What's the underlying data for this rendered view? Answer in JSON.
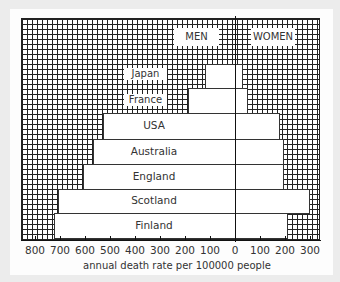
{
  "chart_data": {
    "type": "bar",
    "orientation": "horizontal-population-pyramid",
    "title": "",
    "xlabel": "annual death rate per 100000 people",
    "ylabel": "",
    "legend": [
      "MEN",
      "WOMEN"
    ],
    "categories": [
      "Japan",
      "France",
      "USA",
      "Australia",
      "England",
      "Scotland",
      "Finland"
    ],
    "series": [
      {
        "name": "MEN",
        "values": [
          120,
          190,
          530,
          570,
          610,
          710,
          725
        ]
      },
      {
        "name": "WOMEN",
        "values": [
          30,
          50,
          180,
          195,
          195,
          300,
          210
        ]
      }
    ],
    "x_ticks_left": [
      "800",
      "700",
      "600",
      "500",
      "400",
      "300",
      "200",
      "100"
    ],
    "x_ticks_right": [
      "0",
      "100",
      "200",
      "300"
    ],
    "xlim_men": [
      0,
      800
    ],
    "xlim_women": [
      0,
      350
    ],
    "grid": true
  },
  "labels": {
    "men": "MEN",
    "women": "WOMEN",
    "xtitle": "annual death rate per 100000 people"
  }
}
